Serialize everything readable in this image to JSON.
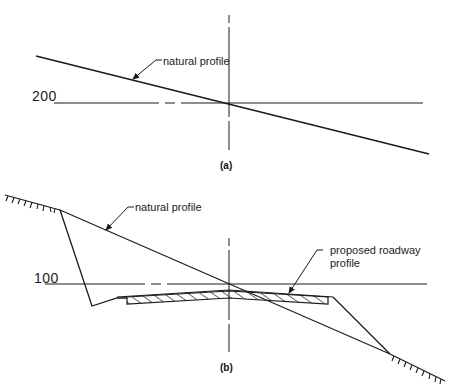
{
  "figure_a": {
    "caption": "(a)",
    "elevation_label": "200",
    "callouts": {
      "natural_profile": "natural profile"
    }
  },
  "figure_b": {
    "caption": "(b)",
    "elevation_label": "100",
    "callouts": {
      "natural_profile": "natural profile",
      "proposed_roadway_line1": "proposed roadway",
      "proposed_roadway_line2": "profile"
    }
  },
  "colors": {
    "line": "#1a1a1a",
    "background": "#ffffff"
  }
}
